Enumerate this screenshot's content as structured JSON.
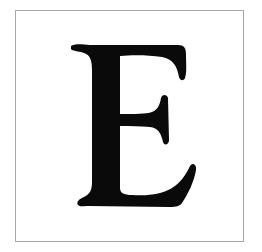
{
  "letter": {
    "character": "E",
    "color": "#0a0a0a"
  },
  "frame": {
    "border_color": "#a8a8a8",
    "background": "#ffffff"
  }
}
